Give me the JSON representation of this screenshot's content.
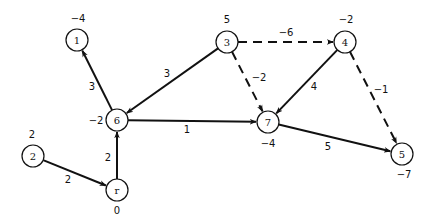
{
  "diagram": {
    "type": "directed-graph",
    "nodes": [
      {
        "id": "1",
        "label": "1",
        "potential": "−4",
        "x": 77,
        "y": 40,
        "px": 78,
        "py": 22
      },
      {
        "id": "3",
        "label": "3",
        "potential": "5",
        "x": 227,
        "y": 42,
        "px": 227,
        "py": 23
      },
      {
        "id": "4",
        "label": "4",
        "potential": "−2",
        "x": 345,
        "y": 42,
        "px": 346,
        "py": 23
      },
      {
        "id": "6",
        "label": "6",
        "potential": "−2",
        "x": 117,
        "y": 120,
        "px": 96,
        "py": 124
      },
      {
        "id": "7",
        "label": "7",
        "potential": "−4",
        "x": 268,
        "y": 122,
        "px": 268,
        "py": 147
      },
      {
        "id": "5",
        "label": "5",
        "potential": "−7",
        "x": 402,
        "y": 154,
        "px": 404,
        "py": 178
      },
      {
        "id": "2",
        "label": "2",
        "potential": "2",
        "x": 33,
        "y": 156,
        "px": 32,
        "py": 138
      },
      {
        "id": "r",
        "label": "r",
        "potential": "0",
        "x": 117,
        "y": 190,
        "px": 117,
        "py": 214
      }
    ],
    "edges": [
      {
        "from": "6",
        "to": "1",
        "weight": "3",
        "style": "solid",
        "lx": 92,
        "ly": 90
      },
      {
        "from": "3",
        "to": "6",
        "weight": "3",
        "style": "solid",
        "lx": 167,
        "ly": 77
      },
      {
        "from": "3",
        "to": "4",
        "weight": "−6",
        "style": "dashed",
        "lx": 286,
        "ly": 36
      },
      {
        "from": "3",
        "to": "7",
        "weight": "−2",
        "style": "dashed",
        "lx": 259,
        "ly": 81
      },
      {
        "from": "4",
        "to": "7",
        "weight": "4",
        "style": "solid",
        "lx": 314,
        "ly": 90
      },
      {
        "from": "4",
        "to": "5",
        "weight": "−1",
        "style": "dashed",
        "lx": 381,
        "ly": 93
      },
      {
        "from": "6",
        "to": "7",
        "weight": "1",
        "style": "solid",
        "lx": 187,
        "ly": 133
      },
      {
        "from": "7",
        "to": "5",
        "weight": "5",
        "style": "solid",
        "lx": 328,
        "ly": 150
      },
      {
        "from": "r",
        "to": "6",
        "weight": "2",
        "style": "solid",
        "lx": 108,
        "ly": 161
      },
      {
        "from": "2",
        "to": "r",
        "weight": "2",
        "style": "solid",
        "lx": 68,
        "ly": 183
      }
    ]
  }
}
